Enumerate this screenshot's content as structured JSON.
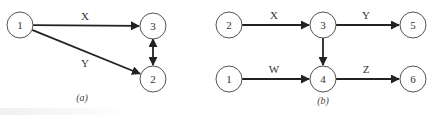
{
  "diagrams": [
    {
      "id": "a",
      "caption": "(a)",
      "caption_pos": [
        82,
        101
      ],
      "nodes": [
        {
          "label": "1",
          "x": 20,
          "y": 25
        },
        {
          "label": "3",
          "x": 153,
          "y": 26
        },
        {
          "label": "2",
          "x": 153,
          "y": 79
        }
      ],
      "edges": [
        {
          "from": "1",
          "to": "3",
          "label": "X",
          "label_pos": [
            85,
            20
          ]
        },
        {
          "from": "1",
          "to": "2",
          "label": "Y",
          "label_pos": [
            85,
            67
          ]
        },
        {
          "from": "3",
          "to": "2",
          "label": "",
          "bidirectional": true
        }
      ]
    },
    {
      "id": "b",
      "caption": "(b)",
      "caption_pos": [
        323,
        104
      ],
      "nodes": [
        {
          "label": "2",
          "x": 229,
          "y": 25
        },
        {
          "label": "3",
          "x": 323,
          "y": 25
        },
        {
          "label": "5",
          "x": 413,
          "y": 25
        },
        {
          "label": "1",
          "x": 229,
          "y": 79
        },
        {
          "label": "4",
          "x": 323,
          "y": 79
        },
        {
          "label": "6",
          "x": 413,
          "y": 79
        }
      ],
      "edges": [
        {
          "from": "2",
          "to": "3",
          "label": "X",
          "label_pos": [
            274,
            19
          ]
        },
        {
          "from": "3",
          "to": "5",
          "label": "Y",
          "label_pos": [
            366,
            19
          ]
        },
        {
          "from": "3",
          "to": "4",
          "label": ""
        },
        {
          "from": "1",
          "to": "4",
          "label": "W",
          "label_pos": [
            274,
            73
          ]
        },
        {
          "from": "4",
          "to": "6",
          "label": "Z",
          "label_pos": [
            366,
            73
          ]
        }
      ]
    }
  ],
  "style": {
    "node_radius": 13,
    "node_stroke": "#555555",
    "edge_color": "#222222",
    "text_color": "#333333"
  }
}
